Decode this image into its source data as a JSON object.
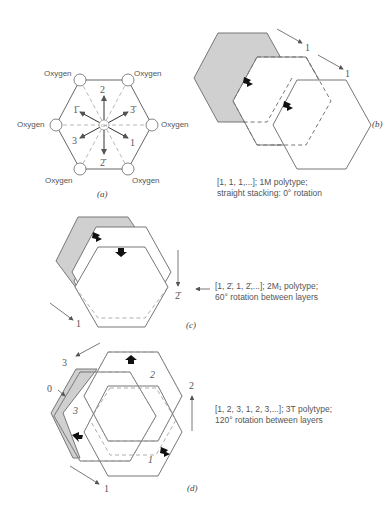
{
  "panel_a": {
    "label": "(a)",
    "center_label": "OH",
    "oxygen_labels": [
      "Oxygen",
      "Oxygen",
      "Oxygen",
      "Oxygen",
      "Oxygen",
      "Oxygen"
    ],
    "directions": [
      "2",
      "3̄",
      "1",
      "2̄",
      "3",
      "1̄"
    ]
  },
  "panel_b": {
    "label": "(b)",
    "arrow_labels": [
      "1",
      "1"
    ],
    "caption_line1": "[1, 1, 1,...]; 1M polytype;",
    "caption_line2": "straight stacking: 0° rotation"
  },
  "panel_c": {
    "label": "(c)",
    "arrow_labels": [
      "2̄",
      "1"
    ],
    "caption_line1": "[1, 2̄, 1, 2̄,...]; 2M₁ polytype;",
    "caption_line2": "60° rotation between layers"
  },
  "panel_d": {
    "label": "(d)",
    "arrow_labels": [
      "3",
      "0",
      "2",
      "1"
    ],
    "layer_labels": [
      "2",
      "3",
      "1"
    ],
    "caption_line1": "[1, 2, 3, 1, 2, 3,...]; 3T polytype;",
    "caption_line2": "120° rotation between layers"
  }
}
